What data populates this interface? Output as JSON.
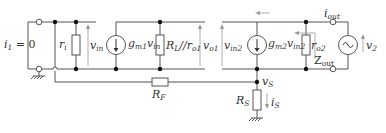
{
  "diagram": {
    "type": "small-signal equivalent circuit",
    "colors": {
      "wire": "#555555",
      "node": "#111111",
      "text": "#333333",
      "arrow": "#999999"
    },
    "labels": {
      "i1": {
        "main": "i",
        "sub": "1",
        "rest": " = 0"
      },
      "ri": {
        "main": "r",
        "sub": "i"
      },
      "vin": {
        "main": "v",
        "sub": "in"
      },
      "gm1": {
        "main": "g",
        "sub": "m1",
        "rest": "v",
        "sub2": "in"
      },
      "rl_ro1": {
        "main": "R",
        "sub": "L",
        "rest": "//r",
        "sub2": "o1"
      },
      "vo1": {
        "main": "v",
        "sub": "o1"
      },
      "vin2": {
        "main": "v",
        "sub": "in2"
      },
      "gm2": {
        "main": "g",
        "sub": "m2",
        "rest": "v",
        "sub2": "in2"
      },
      "ro2": {
        "main": "r",
        "sub": "o2"
      },
      "iout": {
        "main": "i",
        "sub": "out"
      },
      "zout": {
        "main": "Z",
        "sub": "out"
      },
      "v2": {
        "main": "v",
        "sub": "2"
      },
      "rf": {
        "main": "R",
        "sub": "F"
      },
      "vs": {
        "main": "v",
        "sub": "S"
      },
      "rs": {
        "main": "R",
        "sub": "S"
      },
      "is": {
        "main": "i",
        "sub": "S"
      }
    }
  }
}
